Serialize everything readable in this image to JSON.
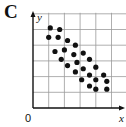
{
  "panel": {
    "label": "C"
  },
  "chart_data": {
    "type": "scatter",
    "title": "C",
    "xlabel": "x",
    "ylabel": "y",
    "origin_label": "0",
    "grid": true,
    "xlim": [
      0,
      6
    ],
    "ylim": [
      0,
      6
    ],
    "ticks_labeled": false,
    "correlation": "negative",
    "points": [
      {
        "x": 1.1,
        "y": 5.1
      },
      {
        "x": 1.7,
        "y": 5.0
      },
      {
        "x": 1.0,
        "y": 4.5
      },
      {
        "x": 1.6,
        "y": 4.5
      },
      {
        "x": 2.2,
        "y": 4.3
      },
      {
        "x": 1.4,
        "y": 3.6
      },
      {
        "x": 2.0,
        "y": 3.7
      },
      {
        "x": 2.7,
        "y": 4.0
      },
      {
        "x": 1.8,
        "y": 3.1
      },
      {
        "x": 2.6,
        "y": 3.4
      },
      {
        "x": 3.2,
        "y": 3.5
      },
      {
        "x": 2.2,
        "y": 2.7
      },
      {
        "x": 2.8,
        "y": 2.9
      },
      {
        "x": 3.6,
        "y": 3.1
      },
      {
        "x": 2.7,
        "y": 2.3
      },
      {
        "x": 3.2,
        "y": 2.5
      },
      {
        "x": 4.0,
        "y": 2.6
      },
      {
        "x": 3.1,
        "y": 1.8
      },
      {
        "x": 3.6,
        "y": 2.1
      },
      {
        "x": 4.5,
        "y": 2.1
      },
      {
        "x": 3.6,
        "y": 1.4
      },
      {
        "x": 4.0,
        "y": 1.8
      },
      {
        "x": 4.7,
        "y": 1.7
      },
      {
        "x": 4.0,
        "y": 1.2
      },
      {
        "x": 4.7,
        "y": 1.2
      }
    ],
    "colors": {
      "points": "#111111",
      "grid": "#9a9a9a",
      "axes": "#111111"
    }
  }
}
